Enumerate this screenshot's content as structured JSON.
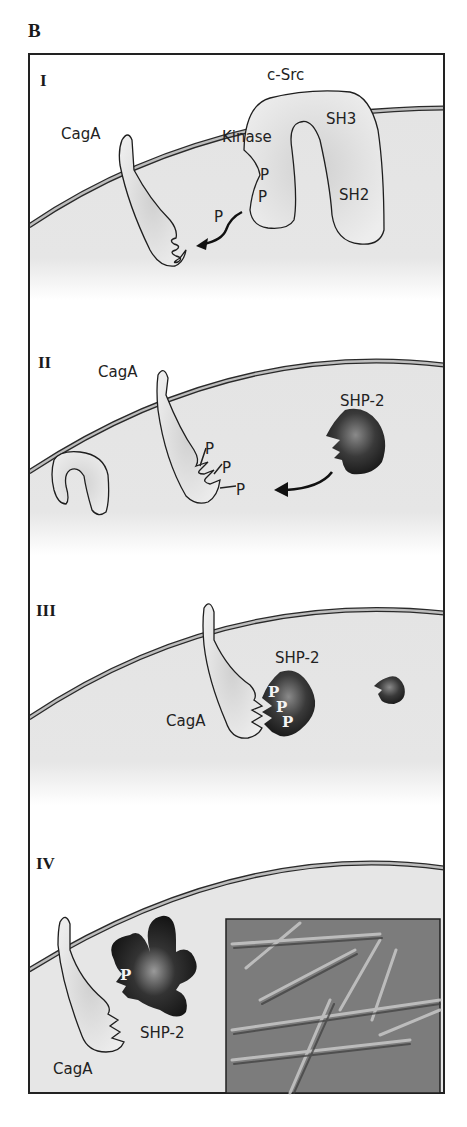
{
  "figure": {
    "panel_letter": "B",
    "colors": {
      "frame": "#222222",
      "cytoplasm": "#e6e6e6",
      "membrane_outer": "#2a2a2a",
      "membrane_inner": "#bdbdbd",
      "protein_light": "#e9e9e9",
      "protein_shade": "#c9c9c9",
      "shp2_dark": "#2b2b2b",
      "shp2_highlight": "#8a8a8a"
    },
    "panels": [
      {
        "numeral": "I",
        "labels": {
          "csrc": "c-Src",
          "kinase": "Kinase",
          "sh3": "SH3",
          "sh2": "SH2",
          "caga": "CagA",
          "p1": "P",
          "p2": "P",
          "p_transfer": "P"
        },
        "description": "c-Src kinase phosphorylates CagA"
      },
      {
        "numeral": "II",
        "labels": {
          "caga": "CagA",
          "shp2": "SHP-2",
          "p1": "P",
          "p2": "P",
          "p3": "P"
        },
        "description": "Phosphorylated CagA attracts SHP-2"
      },
      {
        "numeral": "III",
        "labels": {
          "caga": "CagA",
          "shp2": "SHP-2",
          "p1": "P",
          "p2": "P",
          "p3": "P"
        },
        "description": "SHP-2 binds phosphorylated CagA"
      },
      {
        "numeral": "IV",
        "labels": {
          "caga": "CagA",
          "shp2": "SHP-2",
          "p1": "P"
        },
        "inset": "micrograph of elongated cells",
        "description": "Activated SHP-2 causes cell elongation"
      }
    ]
  }
}
